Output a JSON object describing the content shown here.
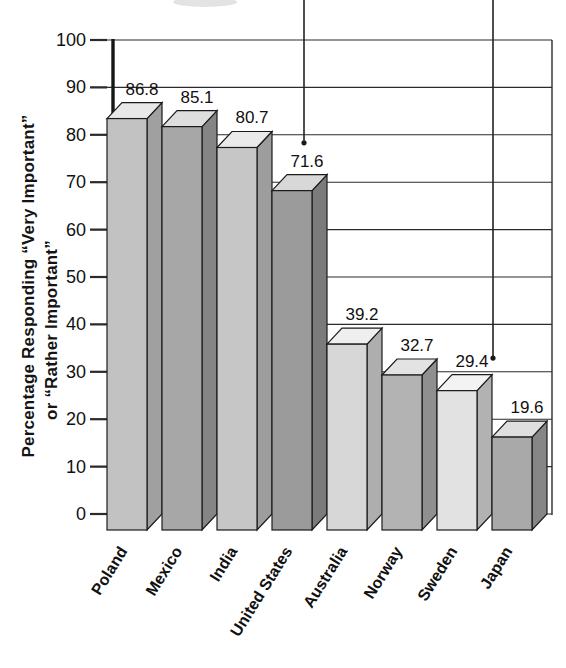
{
  "chart_data": {
    "type": "bar",
    "style": "3d-column",
    "title": "",
    "ylabel_lines": [
      "Percentage Responding “Very Important”",
      "or “Rather Important”"
    ],
    "xlabel": "",
    "categories": [
      "Poland",
      "Mexico",
      "India",
      "United States",
      "Australia",
      "Norway",
      "Sweden",
      "Japan"
    ],
    "values": [
      86.8,
      85.1,
      80.7,
      71.6,
      39.2,
      32.7,
      29.4,
      19.6
    ],
    "value_labels": [
      "86.8",
      "85.1",
      "80.7",
      "71.6",
      "39.2",
      "32.7",
      "29.4",
      "19.6"
    ],
    "ylim": [
      0,
      100
    ],
    "yticks": [
      0,
      10,
      20,
      30,
      40,
      50,
      60,
      70,
      80,
      90,
      100
    ],
    "grid": "horizontal-every-10",
    "legend": "none",
    "background_color": "#ffffff",
    "line_color": "#2b2b2b",
    "bar_outline_color": "#1b1b1b",
    "text_color": "#111111",
    "bar_colors": [
      {
        "front": "#c2c2c2",
        "side": "#a0a0a0",
        "top": "#e8e8e8"
      },
      {
        "front": "#a7a7a7",
        "side": "#858585",
        "top": "#dedede"
      },
      {
        "front": "#c6c6c6",
        "side": "#9d9d9d",
        "top": "#eaeaea"
      },
      {
        "front": "#9b9b9b",
        "side": "#7b7b7b",
        "top": "#d8d8d8"
      },
      {
        "front": "#d7d7d7",
        "side": "#aeaeae",
        "top": "#efefef"
      },
      {
        "front": "#b3b3b3",
        "side": "#8f8f8f",
        "top": "#e3e3e3"
      },
      {
        "front": "#e2e2e2",
        "side": "#b2b2b2",
        "top": "#f3f3f3"
      },
      {
        "front": "#a9a9a9",
        "side": "#868686",
        "top": "#dfdfdf"
      }
    ],
    "annotation_arrows": [
      {
        "points_to": "United States",
        "x_px": 304,
        "tip_value": 78.3
      },
      {
        "points_to": "Sweden",
        "x_px": 493,
        "tip_value": 32.9
      }
    ]
  }
}
